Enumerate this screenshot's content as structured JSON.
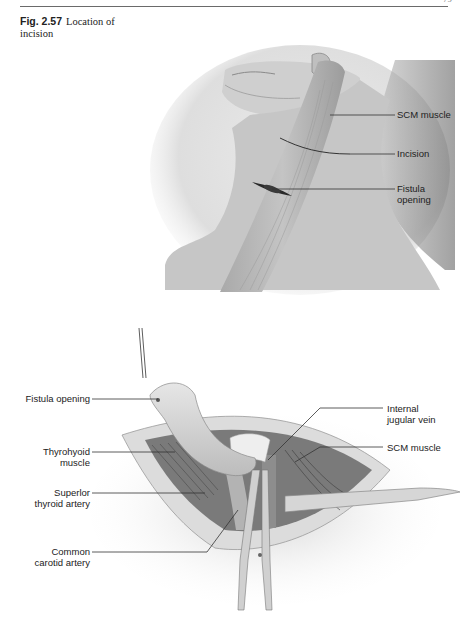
{
  "page": {
    "page_number": "79"
  },
  "caption": {
    "figure_number": "Fig. 2.57",
    "text": "Location of incision"
  },
  "figure_top": {
    "description": "Neck illustration, lateral view, head turned",
    "labels": [
      {
        "id": "scm",
        "line1": "SCM muscle",
        "line2": ""
      },
      {
        "id": "incision",
        "line1": "Incision",
        "line2": ""
      },
      {
        "id": "fistula",
        "line1": "Fistula",
        "line2": "opening"
      }
    ]
  },
  "figure_bottom": {
    "description": "Surgical field with fistula tract dissected",
    "labels_left": [
      {
        "id": "fistula-opening",
        "line1": "Fistula opening",
        "line2": ""
      },
      {
        "id": "thyrohyoid",
        "line1": "Thyrohyoid",
        "line2": "muscle"
      },
      {
        "id": "sup-thyroid",
        "line1": "Superlor",
        "line2": "thyroid artery"
      },
      {
        "id": "carotid",
        "line1": "Common",
        "line2": "carotid artery"
      }
    ],
    "labels_right": [
      {
        "id": "ijv",
        "line1": "Internal",
        "line2": "jugular vein"
      },
      {
        "id": "scm2",
        "line1": "SCM muscle",
        "line2": ""
      }
    ]
  }
}
